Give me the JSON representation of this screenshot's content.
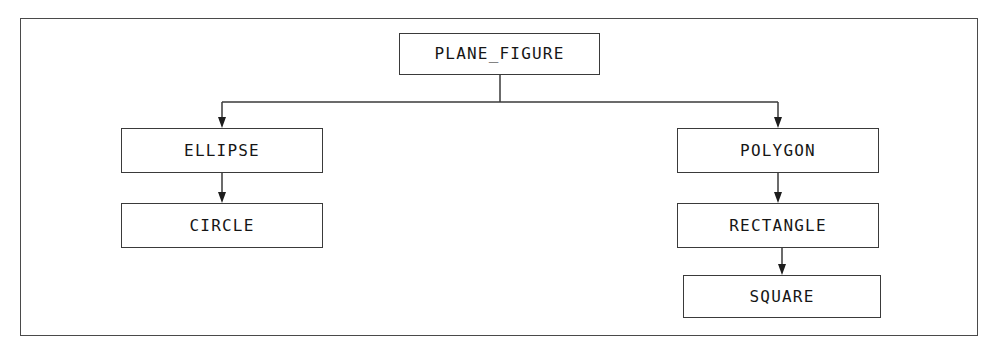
{
  "diagram": {
    "type": "inheritance-tree",
    "background_color": "#ffffff",
    "border_color": "#4a4a4a",
    "node_border_color": "#3a3a3a",
    "text_color": "#161616",
    "arrow_color": "#1d1d1d",
    "nodes": [
      {
        "id": "plane_figure",
        "label": "PLANE_FIGURE",
        "x": 399,
        "y": 33,
        "w": 201,
        "h": 42
      },
      {
        "id": "ellipse",
        "label": "ELLIPSE",
        "x": 121,
        "y": 128,
        "w": 202,
        "h": 45
      },
      {
        "id": "circle",
        "label": "CIRCLE",
        "x": 121,
        "y": 203,
        "w": 202,
        "h": 45
      },
      {
        "id": "polygon",
        "label": "POLYGON",
        "x": 677,
        "y": 128,
        "w": 202,
        "h": 45
      },
      {
        "id": "rectangle",
        "label": "RECTANGLE",
        "x": 677,
        "y": 203,
        "w": 202,
        "h": 45
      },
      {
        "id": "square",
        "label": "SQUARE",
        "x": 683,
        "y": 275,
        "w": 198,
        "h": 43
      }
    ],
    "edges": [
      {
        "from": "plane_figure",
        "to": "ellipse",
        "style": "orthogonal"
      },
      {
        "from": "plane_figure",
        "to": "polygon",
        "style": "orthogonal"
      },
      {
        "from": "ellipse",
        "to": "circle",
        "style": "straight"
      },
      {
        "from": "polygon",
        "to": "rectangle",
        "style": "straight"
      },
      {
        "from": "rectangle",
        "to": "square",
        "style": "straight"
      }
    ]
  }
}
